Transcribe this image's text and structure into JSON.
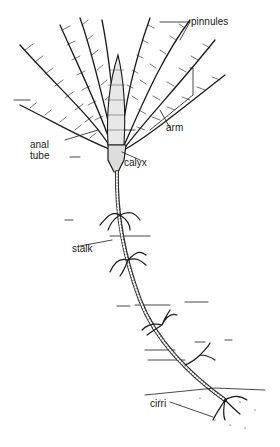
{
  "figure": {
    "labels": {
      "pinnules": "pinnules",
      "arm": "arm",
      "anal_tube_line1": "anal",
      "anal_tube_line2": "tube",
      "calyx": "calyx",
      "stalk": "stalk",
      "cirri": "cirri"
    },
    "colors": {
      "ink": "#1a1a1a",
      "background": "#ffffff"
    }
  }
}
